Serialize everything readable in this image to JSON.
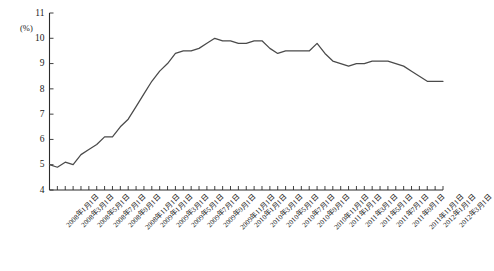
{
  "chart_data": {
    "type": "line",
    "title": "",
    "xlabel": "",
    "ylabel": "",
    "unit_label": "(%)",
    "ylim": [
      4,
      11
    ],
    "ytick_labels": [
      "4",
      "5",
      "6",
      "7",
      "8",
      "9",
      "10",
      "11"
    ],
    "ytick_values": [
      4,
      5,
      6,
      7,
      8,
      9,
      10,
      11
    ],
    "grid": false,
    "legend": "none",
    "x_label_interval": 2,
    "categories": [
      "2008年1月1日",
      "2008年2月1日",
      "2008年3月1日",
      "2008年4月1日",
      "2008年5月1日",
      "2008年6月1日",
      "2008年7月1日",
      "2008年8月1日",
      "2008年9月1日",
      "2008年10月1日",
      "2008年11月1日",
      "2008年12月1日",
      "2009年1月1日",
      "2009年2月1日",
      "2009年3月1日",
      "2009年4月1日",
      "2009年5月1日",
      "2009年6月1日",
      "2009年7月1日",
      "2009年8月1日",
      "2009年9月1日",
      "2009年10月1日",
      "2009年11月1日",
      "2009年12月1日",
      "2010年1月1日",
      "2010年2月1日",
      "2010年3月1日",
      "2010年4月1日",
      "2010年5月1日",
      "2010年6月1日",
      "2010年7月1日",
      "2010年8月1日",
      "2010年9月1日",
      "2010年10月1日",
      "2010年11月1日",
      "2010年12月1日",
      "2011年1月1日",
      "2011年2月1日",
      "2011年3月1日",
      "2011年4月1日",
      "2011年5月1日",
      "2011年6月1日",
      "2011年7月1日",
      "2011年8月1日",
      "2011年9月1日",
      "2011年10月1日",
      "2011年11月1日",
      "2011年12月1日",
      "2012年1月1日",
      "2012年2月1日",
      "2012年3月1日"
    ],
    "values": [
      5.0,
      4.9,
      5.1,
      5.0,
      5.4,
      5.6,
      5.8,
      6.1,
      6.1,
      6.5,
      6.8,
      7.3,
      7.8,
      8.3,
      8.7,
      9.0,
      9.4,
      9.5,
      9.5,
      9.6,
      9.8,
      10.0,
      9.9,
      9.9,
      9.8,
      9.8,
      9.9,
      9.9,
      9.6,
      9.4,
      9.5,
      9.5,
      9.5,
      9.5,
      9.8,
      9.4,
      9.1,
      9.0,
      8.9,
      9.0,
      9.0,
      9.1,
      9.1,
      9.1,
      9.0,
      8.9,
      8.7,
      8.5,
      8.3,
      8.3,
      8.3
    ],
    "x_axis_tick_count": 51
  }
}
